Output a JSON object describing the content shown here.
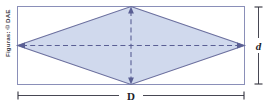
{
  "figure": {
    "type": "geometry-diagram",
    "credit": "Figuras: © DAE",
    "labels": {
      "major_diagonal": "D",
      "minor_diagonal": "d"
    },
    "colors": {
      "rhombus_fill": "#ccd6ec",
      "rhombus_stroke": "#6b6f9e",
      "rectangle_stroke": "#8a8fb8",
      "diagonal_dash": "#5a5f94",
      "dimension_line": "#33333f",
      "background": "#ffffff",
      "credit_text": "#3a3a46"
    },
    "geometry": {
      "rectangle": {
        "x": 17,
        "y": 6,
        "width": 228,
        "height": 79
      },
      "rhombus_vertices": [
        {
          "name": "top",
          "x": 131,
          "y": 6
        },
        {
          "name": "right",
          "x": 245,
          "y": 45.5
        },
        {
          "name": "bottom",
          "x": 131,
          "y": 85
        },
        {
          "name": "left",
          "x": 17,
          "y": 45.5
        }
      ],
      "major_diagonal_axis": "horizontal",
      "minor_diagonal_axis": "vertical"
    },
    "dimension_lines": [
      {
        "name": "major-D",
        "orientation": "horizontal",
        "position": "bottom",
        "label": "D"
      },
      {
        "name": "minor-d",
        "orientation": "vertical",
        "position": "right",
        "label": "d"
      }
    ]
  }
}
